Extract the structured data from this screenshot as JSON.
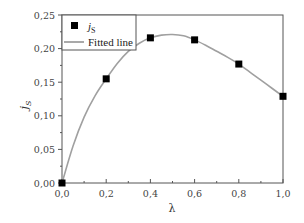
{
  "chart_data": {
    "type": "scatter",
    "title": "",
    "xlabel": "λ",
    "ylabel": "j_S",
    "xlim": [
      0.0,
      1.0
    ],
    "ylim": [
      0.0,
      0.25
    ],
    "x_ticks": [
      "0,0",
      "0,2",
      "0,4",
      "0,6",
      "0,8",
      "1,0"
    ],
    "y_ticks": [
      "0,00",
      "0,05",
      "0,10",
      "0,15",
      "0,20",
      "0,25"
    ],
    "grid": false,
    "legend_position": "upper-left",
    "series": [
      {
        "name": "j_S",
        "type": "scatter",
        "marker": "square",
        "color": "#000000",
        "x": [
          0.0,
          0.2,
          0.4,
          0.6,
          0.8,
          1.0
        ],
        "y": [
          0.0,
          0.155,
          0.216,
          0.213,
          0.177,
          0.129
        ]
      },
      {
        "name": "Fitted line",
        "type": "line",
        "color": "#a0a0a0",
        "x": [
          0.0,
          0.05,
          0.1,
          0.15,
          0.2,
          0.25,
          0.3,
          0.35,
          0.4,
          0.45,
          0.5,
          0.55,
          0.6,
          0.65,
          0.7,
          0.75,
          0.8,
          0.85,
          0.9,
          0.95,
          1.0
        ],
        "y": [
          0.0,
          0.055,
          0.098,
          0.13,
          0.155,
          0.178,
          0.196,
          0.208,
          0.216,
          0.22,
          0.221,
          0.219,
          0.213,
          0.205,
          0.196,
          0.187,
          0.177,
          0.165,
          0.153,
          0.141,
          0.129
        ]
      }
    ]
  },
  "legend": {
    "items": [
      {
        "label_main": "j",
        "label_sub": "S",
        "symbol": "square"
      },
      {
        "label_main": "Fitted line",
        "symbol": "line"
      }
    ]
  },
  "axes": {
    "x_title": "λ",
    "y_title_main": "j",
    "y_title_sub": "S"
  }
}
